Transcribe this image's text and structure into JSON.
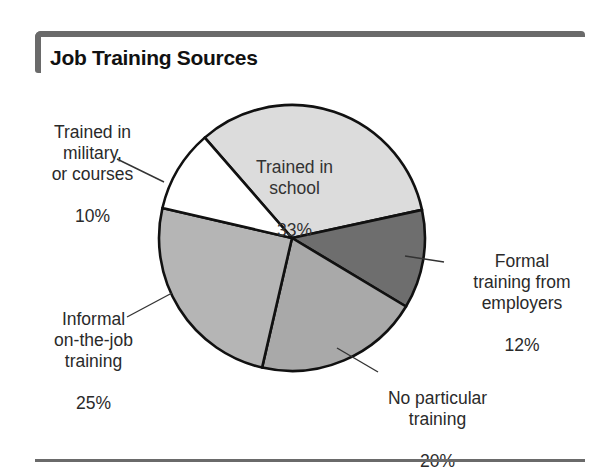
{
  "chart_data": {
    "type": "pie",
    "title": "Job Training Sources",
    "start_angle_deg": -41,
    "slices": [
      {
        "label": "Trained in school",
        "value": 33,
        "color": "#dcdcdc"
      },
      {
        "label": "Formal training from employers",
        "value": 12,
        "color": "#6e6e6e"
      },
      {
        "label": "No particular training",
        "value": 20,
        "color": "#a9a9a9"
      },
      {
        "label": "Informal on-the-job training",
        "value": 25,
        "color": "#b5b5b5"
      },
      {
        "label": "Trained in military, or courses",
        "value": 10,
        "color": "#ffffff"
      }
    ],
    "units": "%"
  },
  "header": {
    "title": "Job Training Sources"
  },
  "labels": {
    "school": {
      "text": "Trained in\nschool",
      "pct": "33%"
    },
    "employers": {
      "text": "Formal\ntraining from\nemployers",
      "pct": "12%"
    },
    "none": {
      "text": "No particular\ntraining",
      "pct": "20%"
    },
    "informal": {
      "text": "Informal\non-the-job\ntraining",
      "pct": "25%"
    },
    "military": {
      "text": "Trained in\nmilitary,\nor courses",
      "pct": "10%"
    }
  }
}
